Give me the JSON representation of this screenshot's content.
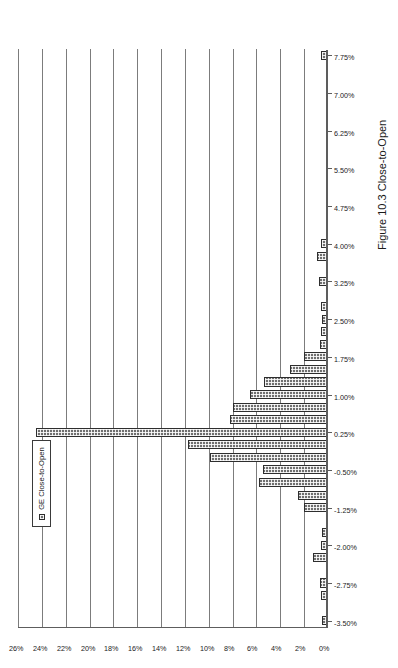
{
  "figure": {
    "caption": "Figure 10.3  Close-to-Open"
  },
  "legend": {
    "position": "top-left",
    "entries": [
      {
        "label": "GE Close-to-Open",
        "color": "#6f6f6f",
        "marker": "legend-swatch-icon"
      }
    ]
  },
  "chart_data": {
    "type": "bar",
    "title": "",
    "subtitle": "",
    "orientation": "vertical-bars-on-rotated-page",
    "xlabel": "",
    "ylabel": "",
    "grid": true,
    "legend_position": "top-left",
    "ylim": [
      0,
      26
    ],
    "ytick_labels": [
      "0%",
      "2%",
      "4%",
      "6%",
      "8%",
      "10%",
      "12%",
      "14%",
      "16%",
      "18%",
      "20%",
      "22%",
      "24%",
      "26%"
    ],
    "ytick_values": [
      0,
      2,
      4,
      6,
      8,
      10,
      12,
      14,
      16,
      18,
      20,
      22,
      24,
      26
    ],
    "xtick_labels": [
      "-3.50%",
      "-2.75%",
      "-2.00%",
      "-1.25%",
      "-0.50%",
      "0.25%",
      "1.00%",
      "1.75%",
      "2.50%",
      "3.25%",
      "4.00%",
      "4.75%",
      "5.50%",
      "6.25%",
      "7.00%",
      "7.75%"
    ],
    "xtick_values": [
      -3.5,
      -2.75,
      -2.0,
      -1.25,
      -0.5,
      0.25,
      1.0,
      1.75,
      2.5,
      3.25,
      4.0,
      4.75,
      5.5,
      6.25,
      7.0,
      7.75
    ],
    "bin_width": 0.25,
    "categories": [
      "-3.50%",
      "-3.25%",
      "-3.00%",
      "-2.75%",
      "-2.50%",
      "-2.25%",
      "-2.00%",
      "-1.75%",
      "-1.50%",
      "-1.25%",
      "-1.00%",
      "-0.75%",
      "-0.50%",
      "-0.25%",
      "0.00%",
      "0.25%",
      "0.50%",
      "0.75%",
      "1.00%",
      "1.25%",
      "1.50%",
      "1.75%",
      "2.00%",
      "2.25%",
      "2.50%",
      "2.75%",
      "3.00%",
      "3.25%",
      "3.50%",
      "3.75%",
      "4.00%",
      "4.25%",
      "4.50%",
      "4.75%",
      "5.00%",
      "5.25%",
      "5.50%",
      "5.75%",
      "6.00%",
      "6.25%",
      "6.50%",
      "6.75%",
      "7.00%",
      "7.25%",
      "7.50%",
      "7.75%"
    ],
    "series": [
      {
        "name": "GE Close-to-Open",
        "color": "#6f6f6f",
        "values": [
          0.4,
          0.0,
          0.5,
          0.6,
          0.0,
          1.2,
          0.5,
          0.4,
          0.0,
          1.9,
          2.4,
          5.7,
          5.4,
          9.8,
          11.7,
          24.4,
          8.1,
          7.9,
          6.5,
          5.3,
          3.1,
          1.9,
          0.6,
          0.5,
          0.4,
          0.5,
          0.0,
          0.7,
          0.0,
          0.8,
          0.5,
          0.0,
          0.0,
          0.0,
          0.0,
          0.0,
          0.0,
          0.0,
          0.0,
          0.0,
          0.0,
          0.0,
          0.0,
          0.0,
          0.0,
          0.5
        ]
      }
    ]
  }
}
